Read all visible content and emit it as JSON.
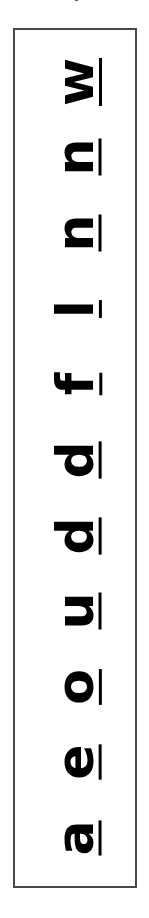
{
  "page": {
    "background_color": "#ffffff",
    "border_color": "#494949",
    "text_color": "#000000",
    "orientation": "rotated-90-counterclockwise"
  },
  "top_fragment": {
    "glyph": "j",
    "description": "clipped-glyph-above-panel"
  },
  "panel": {
    "title": "underlined-letter-column",
    "letters": [
      {
        "char": "w",
        "underlined": true
      },
      {
        "char": "n",
        "underlined": true
      },
      {
        "char": "n",
        "underlined": true
      },
      {
        "char": "l",
        "underlined": true
      },
      {
        "char": "f",
        "underlined": true
      },
      {
        "char": "d",
        "underlined": true
      },
      {
        "char": "d",
        "underlined": true
      },
      {
        "char": "u",
        "underlined": true
      },
      {
        "char": "o",
        "underlined": true
      },
      {
        "char": "e",
        "underlined": true
      },
      {
        "char": "a",
        "underlined": true
      }
    ],
    "reading_order_text": "w n n l f d d u o e a"
  }
}
